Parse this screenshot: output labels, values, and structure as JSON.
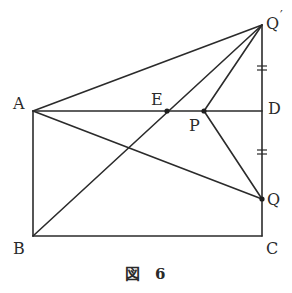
{
  "figure": {
    "caption_char": "図",
    "caption_number": "6",
    "points": {
      "A": {
        "label": "A",
        "x": 33,
        "y": 111
      },
      "B": {
        "label": "B",
        "x": 33,
        "y": 236
      },
      "C": {
        "label": "C",
        "x": 262,
        "y": 236
      },
      "D": {
        "label": "D",
        "x": 262,
        "y": 111
      },
      "Q_prime": {
        "label": "Q",
        "prime": "′",
        "x": 262,
        "y": 25
      },
      "Q": {
        "label": "Q",
        "x": 262,
        "y": 199
      },
      "E": {
        "label": "E",
        "x": 167,
        "y": 111
      },
      "P": {
        "label": "P",
        "x": 204,
        "y": 111
      }
    },
    "segments": [
      "AB",
      "BC",
      "CQ",
      "QD",
      "DQ'",
      "AD",
      "AQ'",
      "AQ",
      "BQ'",
      "PQ'",
      "PQ"
    ],
    "equal_marks": [
      "Q'D",
      "DQ"
    ]
  }
}
